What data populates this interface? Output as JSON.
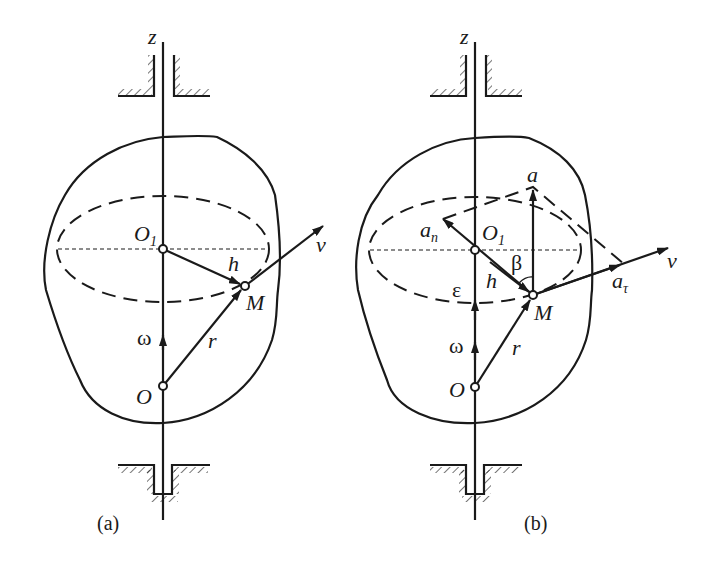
{
  "figure": {
    "colors": {
      "ink": "#1a1a1a",
      "background": "#ffffff"
    },
    "panels": [
      {
        "caption": "(a)",
        "labels": {
          "axis": "z",
          "center": "O",
          "center_sub": "1",
          "point": "M",
          "radius": "h",
          "velocity": "v",
          "angular_velocity": "ω",
          "origin": "O",
          "position": "r"
        }
      },
      {
        "caption": "(b)",
        "labels": {
          "axis": "z",
          "center": "O",
          "center_sub": "1",
          "point": "M",
          "radius": "h",
          "velocity": "v",
          "angular_velocity": "ω",
          "angular_acceleration": "ε",
          "origin": "O",
          "position": "r",
          "acceleration": "a",
          "normal_accel": "a",
          "normal_accel_sub": "n",
          "tangential_accel": "a",
          "tangential_accel_sub": "τ",
          "angle": "β"
        }
      }
    ]
  }
}
